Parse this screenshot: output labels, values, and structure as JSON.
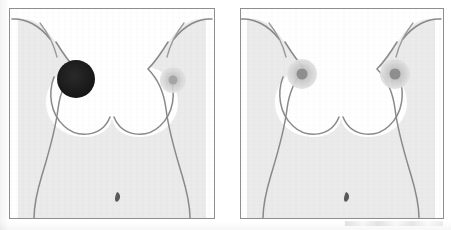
{
  "figure": {
    "background_color": "#ffffff",
    "panel_count": 2
  },
  "style": {
    "frame_border_color": "#8e8e8e",
    "frame_background": "#ffffff",
    "body_fill_color": "#ebebeb",
    "body_outline_color": "#8a8a8a",
    "breast_outline_color": "#8a8a8a",
    "navel_color": "#5a5a5a",
    "outline_width": "1.4"
  },
  "panels": [
    {
      "id": "panel-left",
      "label": "Left panel - abnormal finding",
      "position": "left",
      "frame": {
        "x": 9,
        "y": 8,
        "width": 206,
        "height": 211
      },
      "body": {
        "name": "female-torso",
        "fill": "#ebebeb",
        "outline": "#8a8a8a"
      },
      "navel": {
        "name": "navel",
        "x": 107,
        "y": 188,
        "color": "#5a5a5a"
      },
      "nipples": [
        {
          "id": "left-breast-nipple",
          "side": "viewer-left",
          "finding": "abnormal",
          "appearance": "solid dark filled circle",
          "cx": 66,
          "cy": 70,
          "areola_r": 19,
          "areola_color": "#1c1c1c",
          "nipple_r": 0,
          "nipple_color": "#1c1c1c"
        },
        {
          "id": "right-breast-nipple",
          "side": "viewer-right",
          "finding": "normal",
          "appearance": "pale grey areola with darker centre",
          "cx": 163,
          "cy": 71,
          "areola_r": 13,
          "areola_color": "#cfcfcf",
          "nipple_r": 4.5,
          "nipple_color": "#a6a6a6"
        }
      ]
    },
    {
      "id": "panel-right",
      "label": "Right panel - normal appearance",
      "position": "right",
      "frame": {
        "x": 240,
        "y": 8,
        "width": 204,
        "height": 211
      },
      "body": {
        "name": "female-torso",
        "fill": "#ebebeb",
        "outline": "#8a8a8a"
      },
      "navel": {
        "name": "navel",
        "x": 105,
        "y": 188,
        "color": "#5a5a5a"
      },
      "nipples": [
        {
          "id": "left-breast-nipple",
          "side": "viewer-left",
          "finding": "normal",
          "appearance": "pale grey areola with darker centre",
          "cx": 61,
          "cy": 65,
          "areola_r": 15,
          "areola_color": "#cbcbcb",
          "nipple_r": 5.5,
          "nipple_color": "#8f8f8f"
        },
        {
          "id": "right-breast-nipple",
          "side": "viewer-right",
          "finding": "normal",
          "appearance": "pale grey areola with darker centre",
          "cx": 154,
          "cy": 65,
          "areola_r": 15,
          "areola_color": "#cbcbcb",
          "nipple_r": 5.5,
          "nipple_color": "#8f8f8f"
        }
      ]
    }
  ]
}
